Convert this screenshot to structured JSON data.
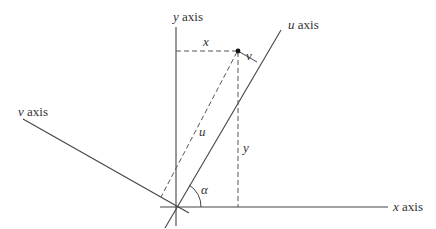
{
  "diagram": {
    "type": "coordinate-rotation",
    "colors": {
      "line": "#444444",
      "dashed": "#555555",
      "text": "#333333",
      "background": "#ffffff"
    },
    "axes": {
      "x": {
        "var": "x",
        "word": "axis"
      },
      "y": {
        "var": "y",
        "word": "axis"
      },
      "u": {
        "var": "u",
        "word": "axis"
      },
      "v": {
        "var": "v",
        "word": "axis"
      }
    },
    "labels": {
      "x_component": "x",
      "y_component": "y",
      "u_component": "u",
      "v_component": "v",
      "angle": "α"
    },
    "point": {
      "name": "P"
    }
  }
}
